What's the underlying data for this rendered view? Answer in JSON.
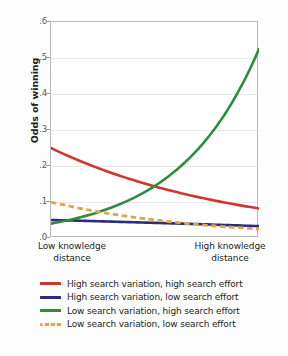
{
  "chart_data": {
    "type": "line",
    "title": "",
    "xlabel": "",
    "ylabel": "Odds of winning",
    "ylim": [
      0,
      0.6
    ],
    "yticks": [
      ".0",
      ".1",
      ".2",
      ".3",
      ".4",
      ".5",
      ".6"
    ],
    "ytick_values": [
      0.0,
      0.1,
      0.2,
      0.3,
      0.4,
      0.5,
      0.6
    ],
    "grid": true,
    "legend_position": "below",
    "x": [
      0,
      1
    ],
    "xtick_labels": [
      "Low knowledge distance",
      "High knowledge distance"
    ],
    "xtick_lines": [
      [
        "Low knowledge",
        "distance"
      ],
      [
        "High knowledge",
        "distance"
      ]
    ],
    "series": [
      {
        "name": "High search variation, high search effort",
        "color": "#d2352c",
        "style": "solid",
        "values": [
          0.25,
          0.082
        ],
        "curve": "convex-decreasing"
      },
      {
        "name": "High search variation, low search effort",
        "color": "#2b2d7a",
        "style": "solid",
        "values": [
          0.05,
          0.033
        ],
        "curve": "near-linear-decreasing"
      },
      {
        "name": "Low search variation, high search effort",
        "color": "#2e8b3f",
        "style": "solid",
        "values": [
          0.04,
          0.525
        ],
        "curve": "convex-increasing"
      },
      {
        "name": "Low search variation, low search effort",
        "color": "#e0a44a",
        "style": "dashed",
        "values": [
          0.1,
          0.025
        ],
        "curve": "convex-decreasing"
      }
    ],
    "annotations": []
  },
  "axis": {
    "y_title": "Odds of winning"
  },
  "xaxis": {
    "low_line1": "Low knowledge",
    "low_line2": "distance",
    "high_line1": "High knowledge",
    "high_line2": "distance"
  },
  "yticks": {
    "t0": ".0",
    "t1": ".1",
    "t2": ".2",
    "t3": ".3",
    "t4": ".4",
    "t5": ".5",
    "t6": ".6"
  },
  "legend": {
    "items": [
      {
        "label": "High search variation, high search effort",
        "color": "#d2352c",
        "style": "solid"
      },
      {
        "label": "High search variation, low search effort",
        "color": "#2b2d7a",
        "style": "solid"
      },
      {
        "label": "Low search variation, high search effort",
        "color": "#2e8b3f",
        "style": "solid"
      },
      {
        "label": "Low search variation, low search effort",
        "color": "#e0a44a",
        "style": "dashed"
      }
    ]
  }
}
